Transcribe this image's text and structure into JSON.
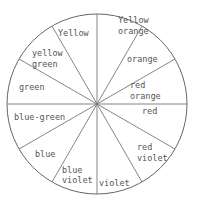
{
  "diagram": {
    "type": "color-wheel",
    "center": [
      97,
      104
    ],
    "radius": 90,
    "divider_angles_deg": [
      -90,
      -60,
      -30,
      0,
      30,
      60,
      90,
      120,
      150,
      180,
      210,
      240
    ],
    "segments": [
      {
        "lines": [
          "Yellow",
          "orange"
        ],
        "x": 118,
        "y": [
          23,
          34
        ]
      },
      {
        "lines": [
          "orange"
        ],
        "x": 127,
        "y": [
          62
        ]
      },
      {
        "lines": [
          "red",
          "orange"
        ],
        "x": 130,
        "y": [
          88,
          99
        ]
      },
      {
        "lines": [
          "red"
        ],
        "x": 142,
        "y": [
          114
        ]
      },
      {
        "lines": [
          "red",
          "violet"
        ],
        "x": 137,
        "y": [
          150,
          161
        ]
      },
      {
        "lines": [
          "violet"
        ],
        "x": 99,
        "y": [
          186
        ]
      },
      {
        "lines": [
          "blue",
          "violet"
        ],
        "x": 62,
        "y": [
          173,
          183
        ]
      },
      {
        "lines": [
          "blue"
        ],
        "x": 35,
        "y": [
          157
        ]
      },
      {
        "lines": [
          "blue-green"
        ],
        "x": 14,
        "y": [
          120
        ]
      },
      {
        "lines": [
          "green"
        ],
        "x": 19,
        "y": [
          90
        ]
      },
      {
        "lines": [
          "yellow",
          "green"
        ],
        "x": 32,
        "y": [
          56,
          67
        ]
      },
      {
        "lines": [
          "Yellow"
        ],
        "x": 58,
        "y": [
          36
        ]
      }
    ]
  }
}
